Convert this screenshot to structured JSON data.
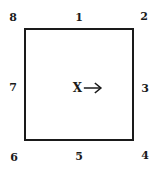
{
  "diagram": {
    "shape": "square",
    "center": {
      "letter": "X",
      "arrow_direction": "right"
    },
    "labels": {
      "top_left": "8",
      "top_middle": "1",
      "top_right": "2",
      "right_middle": "3",
      "bottom_right": "4",
      "bottom_middle": "5",
      "bottom_left": "6",
      "left_middle": "7"
    }
  }
}
